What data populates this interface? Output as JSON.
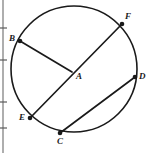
{
  "figure": {
    "width": 149,
    "height": 153,
    "background_color": "#ffffff",
    "stroke_color": "#1a1a1a",
    "label_color": "#1a1a1a"
  },
  "circle": {
    "center_x": 74,
    "center_y": 69,
    "radius": 63,
    "stroke_width": 1.6
  },
  "points": [
    {
      "id": "A",
      "label": "A",
      "x": 72,
      "y": 72,
      "label_x": 76,
      "label_y": 72,
      "role": "center",
      "dot": false
    },
    {
      "id": "B",
      "label": "B",
      "x": 20,
      "y": 41,
      "label_x": 9,
      "label_y": 34,
      "role": "on-circle",
      "dot": true
    },
    {
      "id": "C",
      "label": "C",
      "x": 60,
      "y": 133,
      "label_x": 57,
      "label_y": 137,
      "role": "on-circle",
      "dot": true
    },
    {
      "id": "D",
      "label": "D",
      "x": 135,
      "y": 77,
      "label_x": 139,
      "label_y": 72,
      "role": "on-circle",
      "dot": true
    },
    {
      "id": "E",
      "label": "E",
      "x": 30,
      "y": 118,
      "label_x": 19,
      "label_y": 113,
      "role": "on-circle",
      "dot": true
    },
    {
      "id": "F",
      "label": "F",
      "x": 122,
      "y": 24,
      "label_x": 125,
      "label_y": 12,
      "role": "on-circle",
      "dot": true
    }
  ],
  "segments": [
    {
      "id": "BA",
      "from": "B",
      "to": "A",
      "kind": "radius",
      "x1": 20,
      "y1": 41,
      "x2": 72,
      "y2": 72
    },
    {
      "id": "EF",
      "from": "E",
      "to": "F",
      "kind": "diameter",
      "x1": 30,
      "y1": 118,
      "x2": 122,
      "y2": 24
    },
    {
      "id": "CD",
      "from": "C",
      "to": "D",
      "kind": "chord",
      "x1": 60,
      "y1": 133,
      "x2": 135,
      "y2": 77
    }
  ],
  "left_ruler": {
    "line_x": 3,
    "top": 0,
    "bottom": 153,
    "ticks": [
      28,
      60,
      102,
      128
    ]
  }
}
